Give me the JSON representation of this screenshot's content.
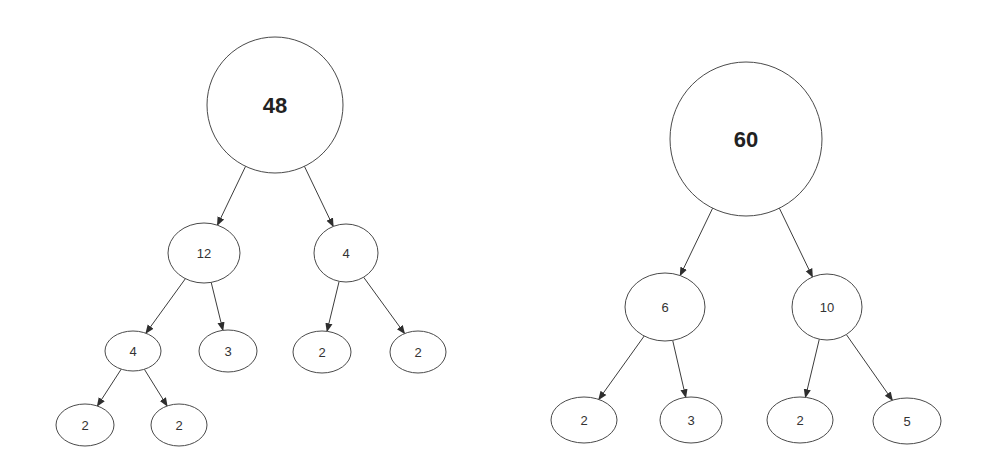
{
  "diagram": {
    "type": "factor-trees",
    "colors": {
      "stroke": "#4a4a4a",
      "text": "#333333",
      "background": "#ffffff"
    },
    "trees": [
      {
        "name": "factor-tree-48",
        "nodes": [
          {
            "id": "n48",
            "label": "48",
            "cx": 275,
            "cy": 105,
            "rx": 68,
            "ry": 68,
            "root": true
          },
          {
            "id": "n12",
            "label": "12",
            "cx": 204,
            "cy": 253,
            "rx": 36,
            "ry": 30
          },
          {
            "id": "n4a",
            "label": "4",
            "cx": 346,
            "cy": 253,
            "rx": 32,
            "ry": 29
          },
          {
            "id": "n4b",
            "label": "4",
            "cx": 133,
            "cy": 351,
            "rx": 28,
            "ry": 20
          },
          {
            "id": "n3",
            "label": "3",
            "cx": 228,
            "cy": 351,
            "rx": 29,
            "ry": 21
          },
          {
            "id": "n2a",
            "label": "2",
            "cx": 322,
            "cy": 352,
            "rx": 29,
            "ry": 21
          },
          {
            "id": "n2b",
            "label": "2",
            "cx": 418,
            "cy": 352,
            "rx": 28,
            "ry": 21
          },
          {
            "id": "n2c",
            "label": "2",
            "cx": 85,
            "cy": 425,
            "rx": 29,
            "ry": 21
          },
          {
            "id": "n2d",
            "label": "2",
            "cx": 179,
            "cy": 425,
            "rx": 28,
            "ry": 21
          }
        ],
        "edges": [
          [
            "n48",
            "n12"
          ],
          [
            "n48",
            "n4a"
          ],
          [
            "n12",
            "n4b"
          ],
          [
            "n12",
            "n3"
          ],
          [
            "n4a",
            "n2a"
          ],
          [
            "n4a",
            "n2b"
          ],
          [
            "n4b",
            "n2c"
          ],
          [
            "n4b",
            "n2d"
          ]
        ]
      },
      {
        "name": "factor-tree-60",
        "nodes": [
          {
            "id": "m60",
            "label": "60",
            "cx": 746,
            "cy": 139,
            "rx": 76,
            "ry": 77,
            "root": true
          },
          {
            "id": "m6",
            "label": "6",
            "cx": 665,
            "cy": 307,
            "rx": 40,
            "ry": 34
          },
          {
            "id": "m10",
            "label": "10",
            "cx": 827,
            "cy": 307,
            "rx": 35,
            "ry": 33
          },
          {
            "id": "m2a",
            "label": "2",
            "cx": 584,
            "cy": 420,
            "rx": 33,
            "ry": 23
          },
          {
            "id": "m3",
            "label": "3",
            "cx": 691,
            "cy": 420,
            "rx": 31,
            "ry": 23
          },
          {
            "id": "m2b",
            "label": "2",
            "cx": 800,
            "cy": 420,
            "rx": 33,
            "ry": 23
          },
          {
            "id": "m5",
            "label": "5",
            "cx": 907,
            "cy": 421,
            "rx": 34,
            "ry": 23
          }
        ],
        "edges": [
          [
            "m60",
            "m6"
          ],
          [
            "m60",
            "m10"
          ],
          [
            "m6",
            "m2a"
          ],
          [
            "m6",
            "m3"
          ],
          [
            "m10",
            "m2b"
          ],
          [
            "m10",
            "m5"
          ]
        ]
      }
    ]
  }
}
